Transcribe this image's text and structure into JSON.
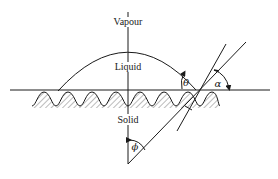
{
  "diagram": {
    "type": "contact-angle-on-rough-surface",
    "regions": {
      "vapour": "Vapour",
      "liquid": "Liquid",
      "solid": "Solid"
    },
    "angles": {
      "theta": "θ",
      "alpha": "α",
      "phi": "ϕ"
    },
    "colors": {
      "line": "#1a1a1a",
      "background": "#ffffff",
      "hatch": "#555555"
    }
  }
}
